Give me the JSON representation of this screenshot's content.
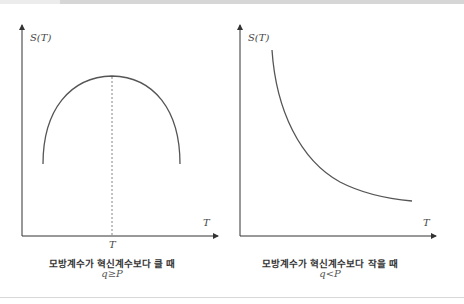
{
  "panels": [
    {
      "id": "left",
      "y_axis_label": "S(T)",
      "x_axis_label": "T",
      "peak_label": "T",
      "caption": "모방계수가 혁신계수보다 클 때",
      "condition": "q≥P",
      "curve_shape": "inverted-u",
      "curve_color": "#555555"
    },
    {
      "id": "right",
      "y_axis_label": "S(T)",
      "x_axis_label": "T",
      "caption": "모방계수가 혁신계수보다 작을 때",
      "condition": "q<P",
      "curve_shape": "decreasing",
      "curve_color": "#555555"
    }
  ],
  "colors": {
    "axis": "#333333",
    "curve": "#555555",
    "dashed": "#666666",
    "topbar": "#d6d6d6",
    "topbar_light": "#ececec"
  }
}
